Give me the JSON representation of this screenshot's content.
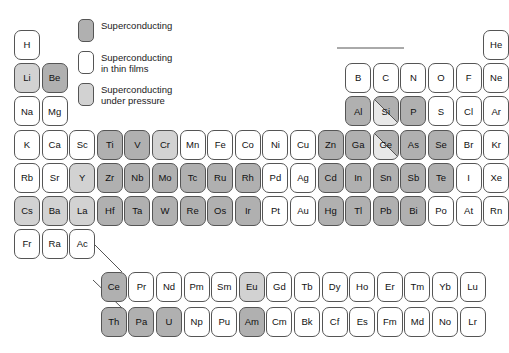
{
  "legend": {
    "items": [
      {
        "label": "Superconducting",
        "swatch_style": "fill-sc",
        "color": "#b0b0b0"
      },
      {
        "label": "Superconducting\nin thin films",
        "swatch_style": "fill-thin",
        "color": "#ffffff"
      },
      {
        "label": "Superconducting\nunder pressure",
        "swatch_style": "fill-pressure",
        "color": "#d2d2d2"
      }
    ]
  },
  "colors": {
    "superconducting": "#b0b0b0",
    "thin_films": "#ffffff",
    "under_pressure": "#d2d2d2",
    "none": "#ffffff",
    "border": "#555555",
    "text": "#111111"
  },
  "chart_data": {
    "type": "table",
    "title": "",
    "elements": [
      {
        "symbol": "H",
        "col": 1,
        "row": 1,
        "state": "none"
      },
      {
        "symbol": "He",
        "col": 18,
        "row": 1,
        "state": "none"
      },
      {
        "symbol": "Li",
        "col": 1,
        "row": 2,
        "state": "under_pressure"
      },
      {
        "symbol": "Be",
        "col": 2,
        "row": 2,
        "state": "superconducting"
      },
      {
        "symbol": "B",
        "col": 13,
        "row": 2,
        "state": "none"
      },
      {
        "symbol": "C",
        "col": 14,
        "row": 2,
        "state": "none"
      },
      {
        "symbol": "N",
        "col": 15,
        "row": 2,
        "state": "none"
      },
      {
        "symbol": "O",
        "col": 16,
        "row": 2,
        "state": "none"
      },
      {
        "symbol": "F",
        "col": 17,
        "row": 2,
        "state": "none"
      },
      {
        "symbol": "Ne",
        "col": 18,
        "row": 2,
        "state": "none"
      },
      {
        "symbol": "Na",
        "col": 1,
        "row": 3,
        "state": "none"
      },
      {
        "symbol": "Mg",
        "col": 2,
        "row": 3,
        "state": "none"
      },
      {
        "symbol": "Al",
        "col": 13,
        "row": 3,
        "state": "superconducting"
      },
      {
        "symbol": "Si",
        "col": 14,
        "row": 3,
        "state": "split"
      },
      {
        "symbol": "P",
        "col": 15,
        "row": 3,
        "state": "superconducting"
      },
      {
        "symbol": "S",
        "col": 16,
        "row": 3,
        "state": "none"
      },
      {
        "symbol": "Cl",
        "col": 17,
        "row": 3,
        "state": "none"
      },
      {
        "symbol": "Ar",
        "col": 18,
        "row": 3,
        "state": "none"
      },
      {
        "symbol": "K",
        "col": 1,
        "row": 4,
        "state": "none"
      },
      {
        "symbol": "Ca",
        "col": 2,
        "row": 4,
        "state": "none"
      },
      {
        "symbol": "Sc",
        "col": 3,
        "row": 4,
        "state": "none"
      },
      {
        "symbol": "Ti",
        "col": 4,
        "row": 4,
        "state": "superconducting"
      },
      {
        "symbol": "V",
        "col": 5,
        "row": 4,
        "state": "superconducting"
      },
      {
        "symbol": "Cr",
        "col": 6,
        "row": 4,
        "state": "under_pressure"
      },
      {
        "symbol": "Mn",
        "col": 7,
        "row": 4,
        "state": "none"
      },
      {
        "symbol": "Fe",
        "col": 8,
        "row": 4,
        "state": "none"
      },
      {
        "symbol": "Co",
        "col": 9,
        "row": 4,
        "state": "none"
      },
      {
        "symbol": "Ni",
        "col": 10,
        "row": 4,
        "state": "none"
      },
      {
        "symbol": "Cu",
        "col": 11,
        "row": 4,
        "state": "none"
      },
      {
        "symbol": "Zn",
        "col": 12,
        "row": 4,
        "state": "superconducting"
      },
      {
        "symbol": "Ga",
        "col": 13,
        "row": 4,
        "state": "superconducting"
      },
      {
        "symbol": "Ge",
        "col": 14,
        "row": 4,
        "state": "split"
      },
      {
        "symbol": "As",
        "col": 15,
        "row": 4,
        "state": "superconducting"
      },
      {
        "symbol": "Se",
        "col": 16,
        "row": 4,
        "state": "superconducting"
      },
      {
        "symbol": "Br",
        "col": 17,
        "row": 4,
        "state": "none"
      },
      {
        "symbol": "Kr",
        "col": 18,
        "row": 4,
        "state": "none"
      },
      {
        "symbol": "Rb",
        "col": 1,
        "row": 5,
        "state": "none"
      },
      {
        "symbol": "Sr",
        "col": 2,
        "row": 5,
        "state": "none"
      },
      {
        "symbol": "Y",
        "col": 3,
        "row": 5,
        "state": "under_pressure"
      },
      {
        "symbol": "Zr",
        "col": 4,
        "row": 5,
        "state": "superconducting"
      },
      {
        "symbol": "Nb",
        "col": 5,
        "row": 5,
        "state": "superconducting"
      },
      {
        "symbol": "Mo",
        "col": 6,
        "row": 5,
        "state": "superconducting"
      },
      {
        "symbol": "Tc",
        "col": 7,
        "row": 5,
        "state": "superconducting"
      },
      {
        "symbol": "Ru",
        "col": 8,
        "row": 5,
        "state": "superconducting"
      },
      {
        "symbol": "Rh",
        "col": 9,
        "row": 5,
        "state": "superconducting"
      },
      {
        "symbol": "Pd",
        "col": 10,
        "row": 5,
        "state": "none"
      },
      {
        "symbol": "Ag",
        "col": 11,
        "row": 5,
        "state": "none"
      },
      {
        "symbol": "Cd",
        "col": 12,
        "row": 5,
        "state": "superconducting"
      },
      {
        "symbol": "In",
        "col": 13,
        "row": 5,
        "state": "superconducting"
      },
      {
        "symbol": "Sn",
        "col": 14,
        "row": 5,
        "state": "superconducting"
      },
      {
        "symbol": "Sb",
        "col": 15,
        "row": 5,
        "state": "superconducting"
      },
      {
        "symbol": "Te",
        "col": 16,
        "row": 5,
        "state": "superconducting"
      },
      {
        "symbol": "I",
        "col": 17,
        "row": 5,
        "state": "none"
      },
      {
        "symbol": "Xe",
        "col": 18,
        "row": 5,
        "state": "none"
      },
      {
        "symbol": "Cs",
        "col": 1,
        "row": 6,
        "state": "under_pressure"
      },
      {
        "symbol": "Ba",
        "col": 2,
        "row": 6,
        "state": "under_pressure"
      },
      {
        "symbol": "La",
        "col": 3,
        "row": 6,
        "state": "under_pressure"
      },
      {
        "symbol": "Hf",
        "col": 4,
        "row": 6,
        "state": "superconducting"
      },
      {
        "symbol": "Ta",
        "col": 5,
        "row": 6,
        "state": "superconducting"
      },
      {
        "symbol": "W",
        "col": 6,
        "row": 6,
        "state": "superconducting"
      },
      {
        "symbol": "Re",
        "col": 7,
        "row": 6,
        "state": "superconducting"
      },
      {
        "symbol": "Os",
        "col": 8,
        "row": 6,
        "state": "superconducting"
      },
      {
        "symbol": "Ir",
        "col": 9,
        "row": 6,
        "state": "superconducting"
      },
      {
        "symbol": "Pt",
        "col": 10,
        "row": 6,
        "state": "none"
      },
      {
        "symbol": "Au",
        "col": 11,
        "row": 6,
        "state": "none"
      },
      {
        "symbol": "Hg",
        "col": 12,
        "row": 6,
        "state": "superconducting"
      },
      {
        "symbol": "Tl",
        "col": 13,
        "row": 6,
        "state": "superconducting"
      },
      {
        "symbol": "Pb",
        "col": 14,
        "row": 6,
        "state": "superconducting"
      },
      {
        "symbol": "Bi",
        "col": 15,
        "row": 6,
        "state": "superconducting"
      },
      {
        "symbol": "Po",
        "col": 16,
        "row": 6,
        "state": "none"
      },
      {
        "symbol": "At",
        "col": 17,
        "row": 6,
        "state": "none"
      },
      {
        "symbol": "Rn",
        "col": 18,
        "row": 6,
        "state": "none"
      },
      {
        "symbol": "Fr",
        "col": 1,
        "row": 7,
        "state": "none"
      },
      {
        "symbol": "Ra",
        "col": 2,
        "row": 7,
        "state": "none"
      },
      {
        "symbol": "Ac",
        "col": 3,
        "row": 7,
        "state": "none"
      }
    ],
    "lanthanides": [
      {
        "symbol": "Ce",
        "state": "superconducting"
      },
      {
        "symbol": "Pr",
        "state": "none"
      },
      {
        "symbol": "Nd",
        "state": "none"
      },
      {
        "symbol": "Pm",
        "state": "none"
      },
      {
        "symbol": "Sm",
        "state": "none"
      },
      {
        "symbol": "Eu",
        "state": "under_pressure"
      },
      {
        "symbol": "Gd",
        "state": "none"
      },
      {
        "symbol": "Tb",
        "state": "none"
      },
      {
        "symbol": "Dy",
        "state": "none"
      },
      {
        "symbol": "Ho",
        "state": "none"
      },
      {
        "symbol": "Er",
        "state": "none"
      },
      {
        "symbol": "Tm",
        "state": "none"
      },
      {
        "symbol": "Yb",
        "state": "none"
      },
      {
        "symbol": "Lu",
        "state": "none"
      }
    ],
    "actinides": [
      {
        "symbol": "Th",
        "state": "superconducting"
      },
      {
        "symbol": "Pa",
        "state": "superconducting"
      },
      {
        "symbol": "U",
        "state": "superconducting"
      },
      {
        "symbol": "Np",
        "state": "none"
      },
      {
        "symbol": "Pu",
        "state": "none"
      },
      {
        "symbol": "Am",
        "state": "superconducting"
      },
      {
        "symbol": "Cm",
        "state": "none"
      },
      {
        "symbol": "Bk",
        "state": "none"
      },
      {
        "symbol": "Cf",
        "state": "none"
      },
      {
        "symbol": "Es",
        "state": "none"
      },
      {
        "symbol": "Fm",
        "state": "none"
      },
      {
        "symbol": "Md",
        "state": "none"
      },
      {
        "symbol": "No",
        "state": "none"
      },
      {
        "symbol": "Lr",
        "state": "none"
      }
    ]
  }
}
